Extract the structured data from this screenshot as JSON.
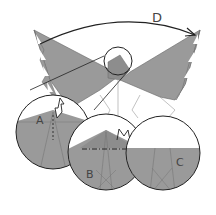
{
  "diagram": {
    "labels": {
      "step_d": "D",
      "detail_a": "A",
      "detail_b": "B",
      "detail_c": "C"
    },
    "colors": {
      "paper": "#9a9a9a",
      "paper_dark": "#888888",
      "paper_light": "#ffffff",
      "line": "#222222",
      "crease": "#6f6f6f"
    },
    "arrows": [
      {
        "id": "D",
        "meaning": "fold left wing over to right across arc"
      },
      {
        "id": "A",
        "meaning": "push / squash arrow (white)"
      },
      {
        "id": "B",
        "meaning": "valley fold along dash-dot line, mountain mark"
      }
    ]
  }
}
